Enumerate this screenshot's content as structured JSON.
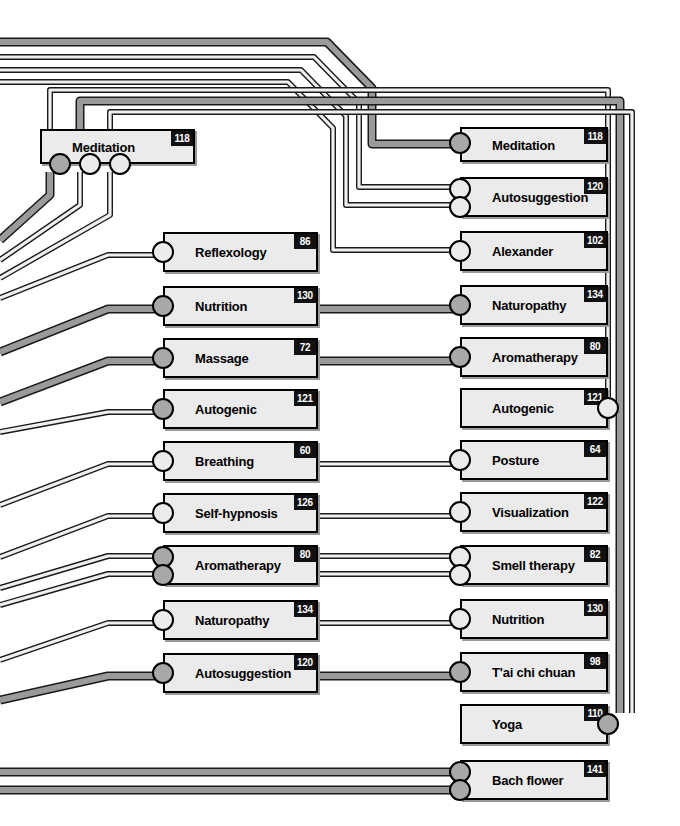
{
  "diagram": {
    "colors": {
      "node_fill": "#ebebeb",
      "node_border": "#000000",
      "badge_bg": "#111111",
      "badge_text": "#ffffff",
      "wire_thin": "#efefef",
      "wire_thick": "#9a9a9a",
      "port_open": "#ebebeb",
      "port_filled": "#a8a8a8"
    },
    "left_column": [
      {
        "label": "Meditation",
        "badge": "118",
        "x": 40,
        "y": 129,
        "w": 155,
        "h": 35,
        "ports": [
          {
            "side": "bottom",
            "offset": 9,
            "style": "fill"
          },
          {
            "side": "bottom",
            "offset": 39,
            "style": "open"
          },
          {
            "side": "bottom",
            "offset": 69,
            "style": "open"
          }
        ]
      },
      {
        "label": "Reflexology",
        "badge": "86",
        "x": 163,
        "y": 232,
        "w": 155,
        "h": 40,
        "ports": [
          {
            "side": "left",
            "offset": 9,
            "style": "open"
          }
        ]
      },
      {
        "label": "Nutrition",
        "badge": "130",
        "x": 163,
        "y": 286,
        "w": 155,
        "h": 40,
        "ports": [
          {
            "side": "left",
            "offset": 9,
            "style": "fill"
          }
        ]
      },
      {
        "label": "Massage",
        "badge": "72",
        "x": 163,
        "y": 338,
        "w": 155,
        "h": 40,
        "ports": [
          {
            "side": "left",
            "offset": 9,
            "style": "fill"
          }
        ]
      },
      {
        "label": "Autogenic",
        "badge": "121",
        "x": 163,
        "y": 389,
        "w": 155,
        "h": 40,
        "ports": [
          {
            "side": "left",
            "offset": 9,
            "style": "fill"
          }
        ]
      },
      {
        "label": "Breathing",
        "badge": "60",
        "x": 163,
        "y": 441,
        "w": 155,
        "h": 40,
        "ports": [
          {
            "side": "left",
            "offset": 9,
            "style": "open"
          }
        ]
      },
      {
        "label": "Self-hypnosis",
        "badge": "126",
        "x": 163,
        "y": 493,
        "w": 155,
        "h": 40,
        "ports": [
          {
            "side": "left",
            "offset": 9,
            "style": "open"
          }
        ]
      },
      {
        "label": "Aromatherapy",
        "badge": "80",
        "x": 163,
        "y": 545,
        "w": 155,
        "h": 40,
        "ports": [
          {
            "side": "left",
            "offset": 1,
            "style": "fill"
          },
          {
            "side": "left",
            "offset": 19,
            "style": "fill"
          }
        ]
      },
      {
        "label": "Naturopathy",
        "badge": "134",
        "x": 163,
        "y": 600,
        "w": 155,
        "h": 40,
        "ports": [
          {
            "side": "left",
            "offset": 9,
            "style": "open"
          }
        ]
      },
      {
        "label": "Autosuggestion",
        "badge": "120",
        "x": 163,
        "y": 653,
        "w": 155,
        "h": 40,
        "ports": [
          {
            "side": "left",
            "offset": 9,
            "style": "fill"
          }
        ]
      }
    ],
    "right_column": [
      {
        "label": "Meditation",
        "badge": "118",
        "x": 460,
        "y": 127,
        "w": 148,
        "h": 35,
        "ports": [
          {
            "side": "left",
            "offset": 5,
            "style": "fill"
          }
        ]
      },
      {
        "label": "Autosuggestion",
        "badge": "120",
        "x": 460,
        "y": 177,
        "w": 148,
        "h": 40,
        "ports": [
          {
            "side": "left",
            "offset": 1,
            "style": "open"
          },
          {
            "side": "left",
            "offset": 19,
            "style": "open"
          }
        ]
      },
      {
        "label": "Alexander",
        "badge": "102",
        "x": 460,
        "y": 231,
        "w": 148,
        "h": 40,
        "ports": [
          {
            "side": "left",
            "offset": 9,
            "style": "open"
          }
        ]
      },
      {
        "label": "Naturopathy",
        "badge": "134",
        "x": 460,
        "y": 285,
        "w": 148,
        "h": 40,
        "ports": [
          {
            "side": "left",
            "offset": 9,
            "style": "fill"
          }
        ]
      },
      {
        "label": "Aromatherapy",
        "badge": "80",
        "x": 460,
        "y": 337,
        "w": 148,
        "h": 40,
        "ports": [
          {
            "side": "left",
            "offset": 9,
            "style": "fill"
          }
        ]
      },
      {
        "label": "Autogenic",
        "badge": "121",
        "x": 460,
        "y": 388,
        "w": 148,
        "h": 40,
        "ports": [
          {
            "side": "right",
            "offset": 9,
            "style": "open"
          }
        ]
      },
      {
        "label": "Posture",
        "badge": "64",
        "x": 460,
        "y": 440,
        "w": 148,
        "h": 40,
        "ports": [
          {
            "side": "left",
            "offset": 9,
            "style": "open"
          }
        ]
      },
      {
        "label": "Visualization",
        "badge": "122",
        "x": 460,
        "y": 492,
        "w": 148,
        "h": 40,
        "ports": [
          {
            "side": "left",
            "offset": 9,
            "style": "open"
          }
        ]
      },
      {
        "label": "Smell therapy",
        "badge": "82",
        "x": 460,
        "y": 545,
        "w": 148,
        "h": 40,
        "ports": [
          {
            "side": "left",
            "offset": 1,
            "style": "open"
          },
          {
            "side": "left",
            "offset": 19,
            "style": "open"
          }
        ]
      },
      {
        "label": "Nutrition",
        "badge": "130",
        "x": 460,
        "y": 599,
        "w": 148,
        "h": 40,
        "ports": [
          {
            "side": "left",
            "offset": 9,
            "style": "open"
          }
        ]
      },
      {
        "label": "T'ai chi chuan",
        "badge": "98",
        "x": 460,
        "y": 652,
        "w": 148,
        "h": 40,
        "ports": [
          {
            "side": "left",
            "offset": 9,
            "style": "fill"
          }
        ]
      },
      {
        "label": "Yoga",
        "badge": "110",
        "x": 460,
        "y": 704,
        "w": 148,
        "h": 40,
        "ports": [
          {
            "side": "right",
            "offset": 9,
            "style": "fill"
          }
        ]
      },
      {
        "label": "Bach flower",
        "badge": "141",
        "x": 460,
        "y": 760,
        "w": 148,
        "h": 40,
        "ports": [
          {
            "side": "left",
            "offset": 1,
            "style": "fill"
          },
          {
            "side": "left",
            "offset": 19,
            "style": "fill"
          }
        ]
      }
    ],
    "wires": [
      {
        "name": "edge-top-1-thick",
        "points": "0,42 327,42 372,88 372,144 460,144",
        "weight": "thick"
      },
      {
        "name": "edge-top-2",
        "points": "0,57 314,57 359,103 359,187 460,187",
        "weight": "thin"
      },
      {
        "name": "edge-top-3",
        "points": "0,70 301,70 346,116 346,205 460,205",
        "weight": "thin"
      },
      {
        "name": "edge-top-4",
        "points": "0,82 288,82 333,128 333,250 460,250",
        "weight": "thin"
      },
      {
        "name": "edge-med-port1-up",
        "points": "50,164 50,90 608,90 608,397",
        "weight": "thin"
      },
      {
        "name": "edge-med-port2-up",
        "points": "80,164 80,101 620,101 620,713",
        "weight": "thick"
      },
      {
        "name": "edge-med-port3-up",
        "points": "110,164 110,112 632,112 632,713",
        "weight": "thin"
      },
      {
        "name": "edge-med-p1-left",
        "points": "50,172 50,195 0,240",
        "weight": "thick"
      },
      {
        "name": "edge-med-p2-left",
        "points": "80,172 80,205 0,260",
        "weight": "thin"
      },
      {
        "name": "edge-med-p3-left",
        "points": "110,172 110,215 0,278",
        "weight": "thin"
      },
      {
        "name": "edge-to-reflexology",
        "points": "0,298 108,255 163,255",
        "weight": "thin"
      },
      {
        "name": "edge-to-nutrition-l",
        "points": "0,352 108,309 163,309",
        "weight": "thick"
      },
      {
        "name": "edge-to-massage-l",
        "points": "0,402 108,361 163,361",
        "weight": "thick"
      },
      {
        "name": "edge-to-autogenic-l",
        "points": "0,432 108,412 163,412",
        "weight": "thin"
      },
      {
        "name": "edge-to-breathing-l",
        "points": "0,505 108,464 163,464",
        "weight": "thin"
      },
      {
        "name": "edge-to-selfhyp-l",
        "points": "0,557 108,516 163,516",
        "weight": "thin"
      },
      {
        "name": "edge-to-aroma-l-a",
        "points": "0,588 108,556 163,556",
        "weight": "thin"
      },
      {
        "name": "edge-to-aroma-l-b",
        "points": "0,605 108,574 163,574",
        "weight": "thin"
      },
      {
        "name": "edge-to-naturo-l",
        "points": "0,660 108,623 163,623",
        "weight": "thin"
      },
      {
        "name": "edge-to-autosug-l",
        "points": "0,700 108,676 163,676",
        "weight": "thick"
      },
      {
        "name": "edge-nutrition-x",
        "points": "318,309 460,309",
        "weight": "thick"
      },
      {
        "name": "edge-massage-x",
        "points": "318,361 460,361",
        "weight": "thick"
      },
      {
        "name": "edge-breathing-x",
        "points": "318,464 460,464",
        "weight": "thin"
      },
      {
        "name": "edge-selfhyp-x",
        "points": "318,516 460,516",
        "weight": "thin"
      },
      {
        "name": "edge-aroma-x-a",
        "points": "318,556 460,556",
        "weight": "thin"
      },
      {
        "name": "edge-aroma-x-b",
        "points": "318,574 460,574",
        "weight": "thin"
      },
      {
        "name": "edge-naturo-x",
        "points": "318,623 460,623",
        "weight": "thin"
      },
      {
        "name": "edge-autosug-x",
        "points": "318,676 460,676",
        "weight": "thick"
      },
      {
        "name": "edge-bach-a",
        "points": "0,772 460,772",
        "weight": "thick"
      },
      {
        "name": "edge-bach-b",
        "points": "0,790 460,790",
        "weight": "thick"
      }
    ]
  }
}
